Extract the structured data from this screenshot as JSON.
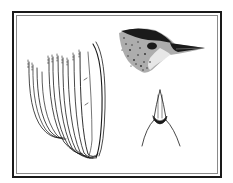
{
  "figure": {
    "type": "scientific-illustration",
    "panels": [
      {
        "id": "wing-feathers",
        "description": "Fanned wing/flight feathers, line drawing"
      },
      {
        "id": "bird-head-lateral",
        "description": "Bird head in side view with pointed beak, stippled"
      },
      {
        "id": "beak-ventral",
        "description": "Beak viewed from below with rictal outline"
      }
    ]
  },
  "colors": {
    "background": "#ffffff",
    "ink": "#1a1a1a",
    "inner_border": "#8a8a8a",
    "stipple": "#555555"
  }
}
